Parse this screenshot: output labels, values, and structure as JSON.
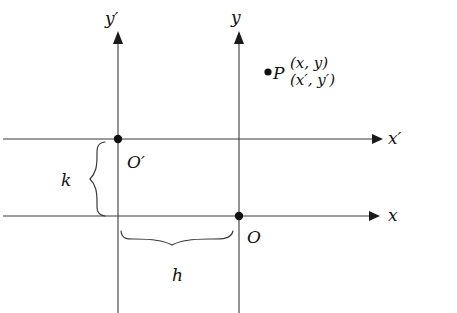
{
  "figure": {
    "colors": {
      "line": "#3a3a3a",
      "text": "#111111",
      "background": "#ffffff"
    },
    "axes": [
      {
        "name": "y-prime-axis",
        "label": "y′",
        "orientation": "vertical"
      },
      {
        "name": "y-axis",
        "label": "y",
        "orientation": "vertical"
      },
      {
        "name": "x-prime-axis",
        "label": "x′",
        "orientation": "horizontal"
      },
      {
        "name": "x-axis",
        "label": "x",
        "orientation": "horizontal"
      }
    ],
    "labels": {
      "y_prime": "y′",
      "y": "y",
      "x_prime": "x′",
      "x": "x",
      "origin_prime": "O′",
      "origin": "O",
      "point": "P",
      "point_coords_unprimed": "(x, y)",
      "point_coords_primed": "(x′, y′)",
      "brace_horizontal": "h",
      "brace_vertical": "k"
    }
  }
}
